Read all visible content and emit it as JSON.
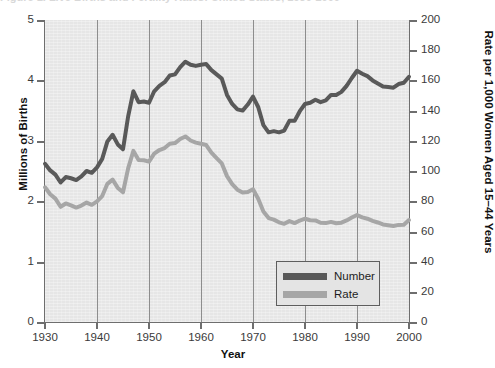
{
  "figure": {
    "title_remnant": "Figure 1. Live Births and Fertility Rates: United States, 1930-2000",
    "xlabel": "Year",
    "ylabel_left": "Millions of Births",
    "ylabel_right": "Rate per 1,000 Women Aged 15–44 Years"
  },
  "legend": {
    "position": "inside-bottom-right",
    "entries": [
      {
        "label": "Number",
        "color": "#595959"
      },
      {
        "label": "Rate",
        "color": "#a6a6a6"
      }
    ]
  },
  "axes": {
    "left_ticks": [
      "5",
      "4",
      "3",
      "2",
      "1",
      "0"
    ],
    "right_ticks": [
      "200",
      "180",
      "160",
      "140",
      "120",
      "100",
      "80",
      "60",
      "40",
      "20",
      "0"
    ],
    "bottom_ticks": [
      "1930",
      "1940",
      "1950",
      "1960",
      "1970",
      "1980",
      "1990",
      "2000"
    ]
  },
  "colors": {
    "plot_background": "#e6e6e6",
    "gridline": "#8d8d8d",
    "axis": "#6e6e6e",
    "number_line": "#595959",
    "rate_line": "#a6a6a6",
    "page_background": "#ffffff"
  },
  "chart_data": {
    "type": "line",
    "title": "Figure 1. Live Births and Fertility Rates: United States, 1930-2000",
    "xlabel": "Year",
    "ylabel": "Millions of Births",
    "ylabel_secondary": "Rate per 1,000 Women Aged 15–44 Years",
    "xlim": [
      1930,
      2000
    ],
    "ylim": [
      0,
      5
    ],
    "ylim_secondary": [
      0,
      200
    ],
    "grid": "vertical-decades",
    "legend_position": "inside-bottom-right",
    "x": [
      1930,
      1931,
      1932,
      1933,
      1934,
      1935,
      1936,
      1937,
      1938,
      1939,
      1940,
      1941,
      1942,
      1943,
      1944,
      1945,
      1946,
      1947,
      1948,
      1949,
      1950,
      1951,
      1952,
      1953,
      1954,
      1955,
      1956,
      1957,
      1958,
      1959,
      1960,
      1961,
      1962,
      1963,
      1964,
      1965,
      1966,
      1967,
      1968,
      1969,
      1970,
      1971,
      1972,
      1973,
      1974,
      1975,
      1976,
      1977,
      1978,
      1979,
      1980,
      1981,
      1982,
      1983,
      1984,
      1985,
      1986,
      1987,
      1988,
      1989,
      1990,
      1991,
      1992,
      1993,
      1994,
      1995,
      1996,
      1997,
      1998,
      1999,
      2000
    ],
    "series": [
      {
        "name": "Number",
        "axis": "left",
        "units": "millions of births",
        "color": "#595959",
        "values": [
          2.62,
          2.51,
          2.44,
          2.31,
          2.4,
          2.38,
          2.35,
          2.41,
          2.5,
          2.47,
          2.56,
          2.7,
          2.99,
          3.1,
          2.94,
          2.86,
          3.41,
          3.82,
          3.64,
          3.65,
          3.63,
          3.82,
          3.91,
          3.97,
          4.08,
          4.1,
          4.22,
          4.31,
          4.26,
          4.24,
          4.26,
          4.27,
          4.17,
          4.1,
          4.03,
          3.76,
          3.61,
          3.52,
          3.5,
          3.6,
          3.73,
          3.56,
          3.26,
          3.14,
          3.16,
          3.14,
          3.17,
          3.33,
          3.33,
          3.49,
          3.61,
          3.63,
          3.68,
          3.64,
          3.67,
          3.76,
          3.76,
          3.81,
          3.91,
          4.04,
          4.16,
          4.11,
          4.07,
          4.0,
          3.95,
          3.9,
          3.89,
          3.88,
          3.94,
          3.96,
          4.06
        ],
        "notes": "Live births in millions; Depression trough 1933, baby boom peak 1957 and 1961, 1970s trough, echo boom peak 1990"
      },
      {
        "name": "Rate",
        "axis": "right",
        "units": "births per 1,000 women aged 15-44",
        "color": "#a6a6a6",
        "values": [
          89.2,
          84.6,
          81.7,
          76.3,
          78.5,
          77.2,
          75.8,
          77.1,
          79.1,
          77.6,
          79.9,
          83.4,
          91.5,
          94.3,
          88.8,
          85.9,
          101.9,
          113.3,
          107.3,
          107.1,
          106.2,
          111.5,
          113.9,
          115.2,
          118.1,
          118.5,
          121.2,
          122.9,
          120.2,
          118.8,
          118.0,
          117.2,
          112.2,
          108.5,
          105.0,
          96.6,
          91.3,
          87.6,
          85.7,
          86.1,
          87.9,
          81.6,
          73.1,
          68.8,
          67.8,
          66.0,
          65.0,
          66.8,
          65.5,
          67.2,
          68.4,
          67.4,
          67.3,
          65.7,
          65.5,
          66.3,
          65.4,
          65.8,
          67.3,
          69.2,
          70.9,
          69.3,
          68.4,
          67.0,
          65.9,
          64.6,
          64.1,
          63.6,
          64.3,
          64.4,
          67.5
        ],
        "notes": "Fertility rate per 1,000 women aged 15-44; peak 1957, trough mid-1970s, flat near 65-70 after 1980"
      }
    ]
  }
}
